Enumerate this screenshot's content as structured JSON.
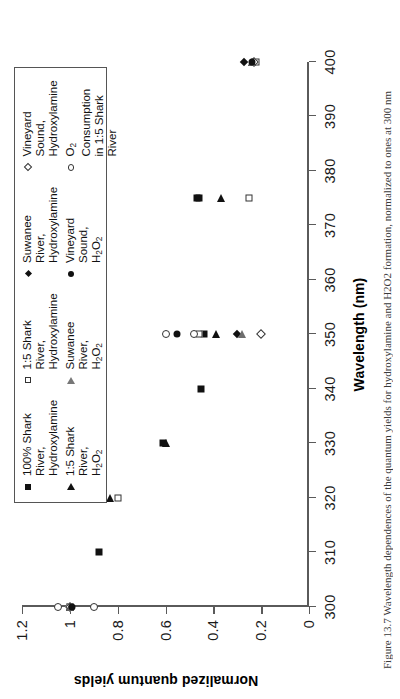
{
  "figure": {
    "caption": "Figure 13.7  Wavelength dependences of the quantum yields for hydroxylamine and H2O2 formation, normalized to ones at 300 nm"
  },
  "axes": {
    "x_title": "Wavelength (nm)",
    "y_title": "Normalized quantum yields",
    "x_ticks": [
      "300",
      "310",
      "320",
      "330",
      "340",
      "350",
      "360",
      "370",
      "380",
      "390",
      "400"
    ],
    "y_ticks": [
      "0",
      "0.2",
      "0.4",
      "0.6",
      "0.8",
      "1",
      "1.2"
    ]
  },
  "legend": {
    "items": [
      {
        "symbol": "filled-square",
        "label": "100% Shark River,\nHydroxylamine"
      },
      {
        "symbol": "open-square",
        "label": "1:5 Shark River,\nHydroxylamine"
      },
      {
        "symbol": "small-filled-diamond",
        "label": "Suwanee River,\nHydroxylamine"
      },
      {
        "symbol": "open-diamond",
        "label": "Vineyard Sound,\nHydroxylamine"
      },
      {
        "symbol": "filled-triangle",
        "label": "1:5 Shark River,\nH2O2"
      },
      {
        "symbol": "open-triangle",
        "label": "Suwanee River,\nH2O2"
      },
      {
        "symbol": "filled-circle",
        "label": "Vineyard Sound,\nH2O2"
      },
      {
        "symbol": "open-circle",
        "label": "O2 Consumption\nin 1:5 Shark River"
      }
    ]
  },
  "chart_data": {
    "type": "scatter",
    "title": "",
    "xlabel": "Wavelength (nm)",
    "ylabel": "Normalized quantum yields",
    "xlim": [
      300,
      400
    ],
    "ylim": [
      0,
      1.2
    ],
    "xticks": [
      300,
      310,
      320,
      330,
      340,
      350,
      360,
      370,
      380,
      390,
      400
    ],
    "yticks": [
      0,
      0.2,
      0.4,
      0.6,
      0.8,
      1,
      1.2
    ],
    "grid": false,
    "legend_position": "top-center",
    "series": [
      {
        "name": "100% Shark River, Hydroxylamine",
        "symbol": "filled-square",
        "points": [
          [
            300,
            1.0
          ],
          [
            310,
            0.88
          ],
          [
            330,
            0.61
          ],
          [
            340,
            0.45
          ],
          [
            350,
            0.44
          ],
          [
            375,
            0.47
          ],
          [
            375,
            0.46
          ]
        ]
      },
      {
        "name": "1:5 Shark River, Hydroxylamine",
        "symbol": "open-square",
        "points": [
          [
            300,
            1.0
          ],
          [
            320,
            0.8
          ],
          [
            350,
            0.46
          ],
          [
            375,
            0.25
          ],
          [
            400,
            0.22
          ]
        ]
      },
      {
        "name": "Suwanee River, Hydroxylamine",
        "symbol": "small-filled-diamond",
        "points": [
          [
            300,
            1.0
          ],
          [
            350,
            0.3
          ],
          [
            400,
            0.27
          ]
        ]
      },
      {
        "name": "Vineyard Sound, Hydroxylamine",
        "symbol": "open-diamond",
        "points": [
          [
            300,
            1.0
          ],
          [
            350,
            0.2
          ],
          [
            400,
            0.23
          ]
        ]
      },
      {
        "name": "1:5 Shark River, H2O2",
        "symbol": "filled-triangle",
        "points": [
          [
            300,
            1.0
          ],
          [
            320,
            0.83
          ],
          [
            330,
            0.6
          ],
          [
            350,
            0.39
          ],
          [
            375,
            0.37
          ],
          [
            400,
            0.24
          ]
        ]
      },
      {
        "name": "Suwanee River, H2O2",
        "symbol": "open-triangle",
        "points": [
          [
            300,
            1.0
          ],
          [
            350,
            0.28
          ],
          [
            400,
            0.24
          ]
        ]
      },
      {
        "name": "Vineyard Sound, H2O2",
        "symbol": "filled-circle",
        "points": [
          [
            300,
            0.99
          ],
          [
            350,
            0.55
          ],
          [
            400,
            0.24
          ]
        ]
      },
      {
        "name": "O2 Consumption in 1:5 Shark River",
        "symbol": "open-circle",
        "points": [
          [
            300,
            1.05
          ],
          [
            300,
            0.9
          ],
          [
            350,
            0.6
          ],
          [
            350,
            0.48
          ]
        ]
      }
    ]
  }
}
